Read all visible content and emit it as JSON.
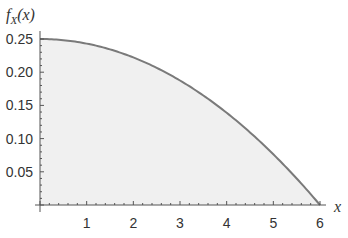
{
  "chart_data": {
    "type": "area",
    "title": "",
    "xlabel": "x",
    "ylabel": "f_X(x)",
    "ylabel_parts": {
      "f": "f",
      "sub": "X",
      "arg": "(x)"
    },
    "xlim": [
      0,
      6
    ],
    "ylim": [
      0,
      0.25
    ],
    "grid": false,
    "legend": null,
    "x_ticks": [
      1,
      2,
      3,
      4,
      5,
      6
    ],
    "x_tick_labels": [
      "1",
      "2",
      "3",
      "4",
      "5",
      "6"
    ],
    "y_ticks": [
      0.05,
      0.1,
      0.15,
      0.2,
      0.25
    ],
    "y_tick_labels": [
      "0.05",
      "0.10",
      "0.15",
      "0.20",
      "0.25"
    ],
    "function": "(36 - x^2)/144",
    "series": [
      {
        "name": "f_X(x)",
        "x": [
          0,
          0.5,
          1,
          1.5,
          2,
          2.5,
          3,
          3.5,
          4,
          4.5,
          5,
          5.5,
          6
        ],
        "values": [
          0.25,
          0.2483,
          0.2431,
          0.2344,
          0.2222,
          0.2066,
          0.1875,
          0.1649,
          0.1389,
          0.1094,
          0.0764,
          0.0399,
          0
        ]
      }
    ],
    "colors": {
      "line": "#7a7a7a",
      "fill": "#f0f0f0",
      "axis": "#555555"
    }
  }
}
